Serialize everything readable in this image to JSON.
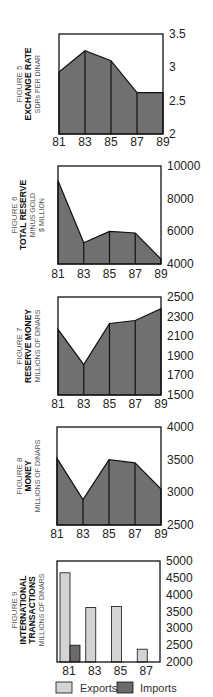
{
  "colors": {
    "area_fill": "#707070",
    "frame": "#111111",
    "exports": "#d4d4d4",
    "imports": "#6a6a6a"
  },
  "chart_data": [
    {
      "type": "area",
      "figure": "FIGURE 5",
      "title": "EXCHANGE RATE",
      "subtitle": "SDRs PER DINAR",
      "x": [
        "81",
        "83",
        "85",
        "87",
        "89"
      ],
      "values": [
        2.93,
        3.25,
        3.1,
        2.62,
        2.62
      ],
      "yticks": [
        "3.5",
        "3",
        "2.5",
        "2"
      ],
      "ylim": [
        2,
        3.5
      ],
      "grid": false
    },
    {
      "type": "area",
      "figure": "FIGURE 6",
      "title": "TOTAL RESERVE",
      "subtitle": "MINUS GOLD",
      "subtitle2": "$  MILLION",
      "x": [
        "81",
        "83",
        "85",
        "87",
        "89"
      ],
      "values": [
        9100,
        5300,
        6000,
        5900,
        4300
      ],
      "yticks": [
        "10000",
        "8000",
        "6000",
        "4000"
      ],
      "ylim": [
        4000,
        10000
      ],
      "grid": false
    },
    {
      "type": "area",
      "figure": "FIGURE  7",
      "title": "RESERVE MONEY",
      "subtitle": "MILLIONS OF DINARS",
      "x": [
        "81",
        "83",
        "85",
        "87",
        "89"
      ],
      "values": [
        2170,
        1810,
        2230,
        2260,
        2380
      ],
      "yticks": [
        "2500",
        "2300",
        "2100",
        "1900",
        "1700",
        "1500"
      ],
      "ylim": [
        1500,
        2500
      ],
      "grid": false
    },
    {
      "type": "area",
      "figure": "FIGURE  8",
      "title": "MONEY",
      "subtitle": "MILLIONS OF DINARS",
      "x": [
        "81",
        "83",
        "85",
        "87",
        "89"
      ],
      "values": [
        3520,
        2890,
        3500,
        3450,
        3050
      ],
      "yticks": [
        "4000",
        "3500",
        "3000",
        "2500"
      ],
      "ylim": [
        2500,
        4000
      ],
      "grid": false
    },
    {
      "type": "bar",
      "figure": "FIGURE 9",
      "title": "INTERNATIONAL",
      "title2": "TRANSACTIONS",
      "subtitle": "MILLIONS OF DINARS",
      "categories": [
        "81",
        "83",
        "85",
        "87"
      ],
      "series": [
        {
          "name": "Exports",
          "values": [
            4650,
            3620,
            3650,
            2380
          ]
        },
        {
          "name": "Imports",
          "values": [
            2500,
            2000,
            2000,
            2000
          ]
        }
      ],
      "yticks": [
        "5000",
        "4500",
        "4000",
        "3500",
        "3000",
        "2500",
        "2000"
      ],
      "ylim": [
        2000,
        5000
      ],
      "legend": [
        "Exports",
        "Imports"
      ],
      "legend_position": "bottom",
      "grid": false
    }
  ]
}
